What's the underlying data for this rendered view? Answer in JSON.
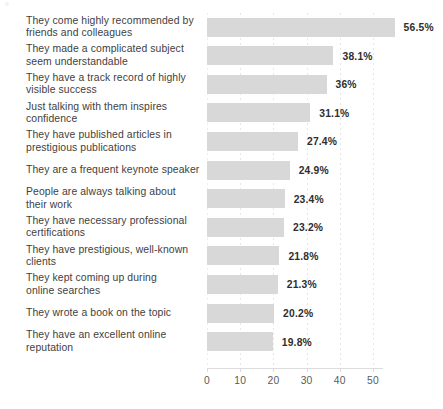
{
  "chart_data": {
    "type": "bar",
    "orientation": "horizontal",
    "title": "",
    "subtitle": "",
    "xlabel": "",
    "ylabel": "",
    "xlim": [
      0,
      53
    ],
    "xticks": [
      0,
      10,
      20,
      30,
      40,
      50
    ],
    "xtick_labels": [
      "0",
      "10",
      "20",
      "30",
      "40",
      "50"
    ],
    "grid": true,
    "grid_axis": "x",
    "grid_style": "dotted",
    "legend": false,
    "legend_position": "none",
    "bar_color": "#d8d8d8",
    "label_color": "#414141",
    "value_label_color": "#2e2e2e",
    "value_suffix": "%",
    "categories": [
      "They come highly recommended by\nfriends and colleagues",
      "They made a complicated subject\nseem understandable",
      "They have a track record of highly\nvisible success",
      "Just talking with them inspires\nconfidence",
      "They have published articles in\nprestigious publications",
      "They are a frequent keynote speaker",
      "People are always talking about\ntheir work",
      "They have necessary professional\ncertifications",
      "They have prestigious, well-known\nclients",
      "They kept coming up during\nonline searches",
      "They wrote a book on the topic",
      "They have an excellent online reputation"
    ],
    "values": [
      56.5,
      38.1,
      36,
      31.1,
      27.4,
      24.9,
      23.4,
      23.2,
      21.8,
      21.3,
      20.2,
      19.8
    ],
    "value_labels": [
      "56.5%",
      "38.1%",
      "36%",
      "31.1%",
      "27.4%",
      "24.9%",
      "23.4%",
      "23.2%",
      "21.8%",
      "21.3%",
      "20.2%",
      "19.8%"
    ]
  }
}
